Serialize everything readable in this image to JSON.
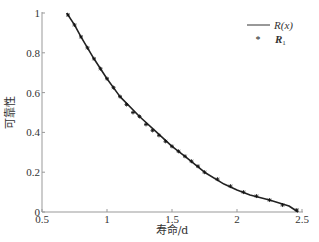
{
  "chart_data": {
    "type": "line",
    "title": "",
    "xlabel": "寿命/d",
    "ylabel": "可靠性",
    "xlim": [
      0.5,
      2.5
    ],
    "ylim": [
      0,
      1
    ],
    "xticks": [
      "0.5",
      "1",
      "1.5",
      "2",
      "2.5"
    ],
    "yticks": [
      "0",
      "0.2",
      "0.4",
      "0.6",
      "0.8",
      "1"
    ],
    "grid": false,
    "legend_position": "upper right",
    "series": [
      {
        "name": "R(x)",
        "style": "solid line",
        "x": [
          0.69,
          0.75,
          0.8,
          0.9,
          1.0,
          1.1,
          1.25,
          1.4,
          1.5,
          1.6,
          1.75,
          1.9,
          2.0,
          2.1,
          2.25,
          2.4,
          2.47
        ],
        "values": [
          1.0,
          0.94,
          0.88,
          0.77,
          0.67,
          0.58,
          0.48,
          0.39,
          0.33,
          0.28,
          0.2,
          0.14,
          0.11,
          0.085,
          0.06,
          0.03,
          0.0
        ]
      },
      {
        "name": "R1",
        "style": "star markers",
        "x": [
          0.7,
          0.75,
          0.8,
          0.85,
          0.9,
          0.95,
          1.0,
          1.05,
          1.1,
          1.15,
          1.2,
          1.25,
          1.3,
          1.35,
          1.4,
          1.45,
          1.5,
          1.55,
          1.6,
          1.65,
          1.7,
          1.75,
          1.85,
          1.95,
          2.05,
          2.15,
          2.25,
          2.35,
          2.46
        ],
        "values": [
          0.99,
          0.94,
          0.88,
          0.825,
          0.77,
          0.72,
          0.67,
          0.625,
          0.58,
          0.54,
          0.5,
          0.48,
          0.44,
          0.41,
          0.385,
          0.355,
          0.33,
          0.305,
          0.28,
          0.255,
          0.23,
          0.2,
          0.165,
          0.13,
          0.1,
          0.08,
          0.06,
          0.035,
          0.01
        ]
      }
    ]
  },
  "legend": {
    "items": [
      {
        "label": "R(x)",
        "marker": "line"
      },
      {
        "label": "R",
        "subscript": "1",
        "marker": "star"
      }
    ]
  },
  "axes": {
    "xlabel": "寿命/d",
    "ylabel": "可靠性"
  },
  "colors": {
    "line": "#222222",
    "axis": "#888888",
    "text": "#333333"
  }
}
